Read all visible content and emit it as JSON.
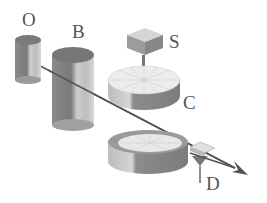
{
  "diagram": {
    "type": "experimental apparatus (beam through components)",
    "labels": {
      "O": "O",
      "B": "B",
      "S": "S",
      "C": "C",
      "D": "D"
    },
    "colors": {
      "stroke": "#555555",
      "dark": "#7a7a7a",
      "mid": "#a8a8a8",
      "light": "#d8d8d8"
    }
  }
}
